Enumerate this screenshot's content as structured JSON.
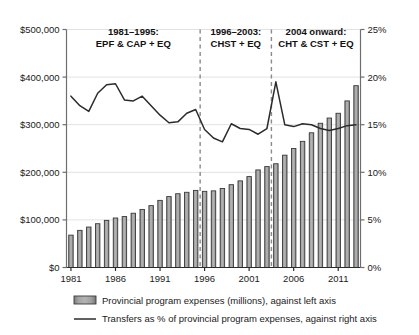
{
  "chart_data": {
    "type": "bar",
    "title": "",
    "xlabel": "",
    "ylabel": "",
    "y2label": "",
    "grid": true,
    "legend_position": "bottom",
    "x": [
      1981,
      1982,
      1983,
      1984,
      1985,
      1986,
      1987,
      1988,
      1989,
      1990,
      1991,
      1992,
      1993,
      1994,
      1995,
      1996,
      1997,
      1998,
      1999,
      2000,
      2001,
      2002,
      2003,
      2004,
      2005,
      2006,
      2007,
      2008,
      2009,
      2010,
      2011,
      2012,
      2013
    ],
    "xtick_labels": [
      "1981",
      "1986",
      "1991",
      "1996",
      "2001",
      "2006",
      "2011"
    ],
    "xticks": [
      1981,
      1986,
      1991,
      1996,
      2001,
      2006,
      2011
    ],
    "ylim": [
      0,
      500000
    ],
    "yticks": [
      0,
      100000,
      200000,
      300000,
      400000,
      500000
    ],
    "ytick_labels": [
      "$0",
      "$100,000",
      "$200,000",
      "$300,000",
      "$400,000",
      "$500,000"
    ],
    "y2lim": [
      0,
      25
    ],
    "y2ticks": [
      0,
      5,
      10,
      15,
      20,
      25
    ],
    "y2tick_labels": [
      "0%",
      "5%",
      "10%",
      "15%",
      "20%",
      "25%"
    ],
    "series": [
      {
        "name": "Provincial program expenses (millions), against left axis",
        "type": "bar",
        "axis": "left",
        "color": "#8c8c8c",
        "edge_color": "#3a3a3a",
        "values": [
          68000,
          78000,
          85000,
          92000,
          99000,
          104000,
          107000,
          114000,
          122000,
          130000,
          141000,
          149000,
          155000,
          158000,
          162000,
          160000,
          161000,
          166000,
          174000,
          182000,
          191000,
          205000,
          212000,
          218000,
          236000,
          250000,
          265000,
          283000,
          303000,
          314000,
          324000,
          350000,
          382000
        ]
      },
      {
        "name": "Transfers as % of provincial program expenses, against right axis",
        "type": "line",
        "axis": "right",
        "color": "#2b2b2b",
        "values": [
          18.0,
          17.0,
          16.4,
          18.3,
          19.2,
          19.3,
          17.6,
          17.5,
          18.0,
          17.0,
          16.0,
          15.2,
          15.3,
          16.2,
          16.6,
          14.5,
          13.6,
          13.2,
          15.1,
          14.6,
          14.5,
          14.0,
          14.6,
          19.5,
          15.0,
          14.8,
          15.1,
          15.0,
          14.6,
          14.4,
          14.6,
          14.9,
          15.0
        ]
      }
    ],
    "annotations": [
      {
        "id": "period-1",
        "line1": "1981–1995:",
        "line2": "EPF & CAP + EQ"
      },
      {
        "id": "period-2",
        "line1": "1996–2003:",
        "line2": "CHST + EQ"
      },
      {
        "id": "period-3",
        "line1": "2004 onward:",
        "line2": "CHT & CST + EQ"
      }
    ],
    "dividers": [
      1995.5,
      2003.5
    ]
  },
  "legend": {
    "items": [
      {
        "marker": "bar-swatch",
        "label": "Provincial program expenses (millions), against left axis"
      },
      {
        "marker": "line-swatch",
        "label": "Transfers as % of provincial program expenses, against right axis"
      }
    ]
  },
  "colors": {
    "bar_fill": "#8c8c8c",
    "bar_edge": "#3a3a3a",
    "line": "#2b2b2b",
    "axis": "#6e6e6e",
    "grid": "#e2e2e2",
    "divider": "#8a8a8a",
    "background": "#ffffff",
    "text": "#1a1a1a"
  }
}
